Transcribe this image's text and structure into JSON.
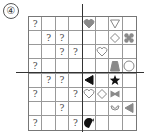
{
  "problem_label": "④",
  "grid": {
    "rows": 8,
    "cols": 8
  },
  "axes": {
    "vertical_between_cols": [
      3,
      4
    ],
    "horizontal_between_rows": [
      3,
      4
    ]
  },
  "colors": {
    "gray": "#8a8a8a",
    "black": "#111111",
    "outline": "#888888"
  },
  "cells": [
    {
      "r": 0,
      "c": 0,
      "type": "question",
      "text": "?"
    },
    {
      "r": 0,
      "c": 4,
      "type": "shape",
      "shape": "heart",
      "fill": "gray"
    },
    {
      "r": 0,
      "c": 6,
      "type": "shape",
      "shape": "triangle-down",
      "fill": "white"
    },
    {
      "r": 1,
      "c": 1,
      "type": "question",
      "text": "?"
    },
    {
      "r": 1,
      "c": 2,
      "type": "question",
      "text": "?"
    },
    {
      "r": 1,
      "c": 6,
      "type": "shape",
      "shape": "diamond",
      "fill": "white"
    },
    {
      "r": 1,
      "c": 7,
      "type": "shape",
      "shape": "clover-cross",
      "fill": "gray"
    },
    {
      "r": 2,
      "c": 2,
      "type": "question",
      "text": "?"
    },
    {
      "r": 2,
      "c": 3,
      "type": "question",
      "text": "?"
    },
    {
      "r": 2,
      "c": 5,
      "type": "shape",
      "shape": "heart",
      "fill": "white"
    },
    {
      "r": 3,
      "c": 0,
      "type": "question",
      "text": "?"
    },
    {
      "r": 3,
      "c": 6,
      "type": "shape",
      "shape": "trapezoid",
      "fill": "gray"
    },
    {
      "r": 3,
      "c": 7,
      "type": "shape",
      "shape": "circle",
      "fill": "white"
    },
    {
      "r": 4,
      "c": 1,
      "type": "question",
      "text": "?"
    },
    {
      "r": 4,
      "c": 2,
      "type": "question",
      "text": "?"
    },
    {
      "r": 4,
      "c": 4,
      "type": "shape",
      "shape": "triangle-left",
      "fill": "black"
    },
    {
      "r": 4,
      "c": 6,
      "type": "shape",
      "shape": "star",
      "fill": "black"
    },
    {
      "r": 5,
      "c": 0,
      "type": "question",
      "text": "?"
    },
    {
      "r": 5,
      "c": 3,
      "type": "question",
      "text": "?"
    },
    {
      "r": 5,
      "c": 4,
      "type": "shape",
      "shape": "heart",
      "fill": "white"
    },
    {
      "r": 5,
      "c": 5,
      "type": "shape",
      "shape": "diamond",
      "fill": "white"
    },
    {
      "r": 5,
      "c": 6,
      "type": "shape",
      "shape": "bowtie",
      "fill": "gray"
    },
    {
      "r": 6,
      "c": 2,
      "type": "question",
      "text": "?"
    },
    {
      "r": 6,
      "c": 6,
      "type": "shape",
      "shape": "smile-arc",
      "fill": "white"
    },
    {
      "r": 6,
      "c": 7,
      "type": "shape",
      "shape": "triangle-left",
      "fill": "gray"
    },
    {
      "r": 7,
      "c": 0,
      "type": "question",
      "text": "?"
    },
    {
      "r": 7,
      "c": 3,
      "type": "question",
      "text": "?"
    },
    {
      "r": 7,
      "c": 4,
      "type": "shape",
      "shape": "teardrop",
      "fill": "black"
    }
  ]
}
